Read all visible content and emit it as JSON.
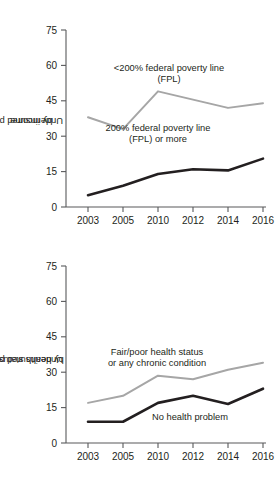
{
  "chart_data": [
    {
      "id": "income",
      "type": "line",
      "title": "",
      "xlabel": "",
      "ylabel": "Underinsured percentages by income",
      "ylabel_lines": [
        "Underinsured percentages",
        "by income"
      ],
      "categories": [
        "2003",
        "2005",
        "2010",
        "2012",
        "2014",
        "2016"
      ],
      "x": [
        2003,
        2005,
        2010,
        2012,
        2014,
        2016
      ],
      "ylim": [
        0,
        75
      ],
      "yticks": [
        0,
        15,
        30,
        45,
        60,
        75
      ],
      "ytick_labels": [
        "0",
        "15",
        "30",
        "45",
        "60",
        "75"
      ],
      "grid": false,
      "legend": "annotations",
      "series": [
        {
          "name": "<200% federal poverty line (FPL)",
          "label_lines": [
            "<200% federal poverty line",
            "(FPL)"
          ],
          "color": "#a6a6a6",
          "width": 2.0,
          "values": [
            38,
            33,
            49,
            45.5,
            42,
            44
          ]
        },
        {
          "name": "200% federal poverty line (FPL) or more",
          "label_lines": [
            "200% federal poverty line",
            "(FPL) or more"
          ],
          "color": "#231f20",
          "width": 2.6,
          "values": [
            5,
            9,
            14,
            16,
            15.5,
            20.5
          ]
        }
      ]
    },
    {
      "id": "health",
      "type": "line",
      "title": "",
      "xlabel": "",
      "ylabel": "Underinsured percentages by health status",
      "ylabel_lines": [
        "Underinsured percentages",
        "by health status"
      ],
      "categories": [
        "2003",
        "2005",
        "2010",
        "2012",
        "2014",
        "2016"
      ],
      "x": [
        2003,
        2005,
        2010,
        2012,
        2014,
        2016
      ],
      "ylim": [
        0,
        75
      ],
      "yticks": [
        0,
        15,
        30,
        45,
        60,
        75
      ],
      "ytick_labels": [
        "0",
        "15",
        "30",
        "45",
        "60",
        "75"
      ],
      "grid": false,
      "legend": "annotations",
      "series": [
        {
          "name": "Fair/poor health status or any chronic condition",
          "label_lines": [
            "Fair/poor health status",
            "or any chronic condition"
          ],
          "color": "#a6a6a6",
          "width": 2.0,
          "values": [
            17,
            20,
            28.5,
            27,
            31,
            34
          ]
        },
        {
          "name": "No health problem",
          "label_lines": [
            "No health problem"
          ],
          "color": "#231f20",
          "width": 2.6,
          "values": [
            9,
            9,
            17,
            20,
            16.5,
            23
          ]
        }
      ]
    }
  ],
  "panels": {
    "income": {
      "ylabel_line1": "Underinsured percentages",
      "ylabel_line2": "by income",
      "annot_a_line1": "<200% federal poverty line",
      "annot_a_line2": "(FPL)",
      "annot_b_line1": "200% federal poverty line",
      "annot_b_line2": "(FPL) or more",
      "ytick_0": "0",
      "ytick_15": "15",
      "ytick_30": "30",
      "ytick_45": "45",
      "ytick_60": "60",
      "ytick_75": "75",
      "xtick_0": "2003",
      "xtick_1": "2005",
      "xtick_2": "2010",
      "xtick_3": "2012",
      "xtick_4": "2014",
      "xtick_5": "2016"
    },
    "health": {
      "ylabel_line1": "Underinsured percentages",
      "ylabel_line2": "by health status",
      "annot_a_line1": "Fair/poor health status",
      "annot_a_line2": "or any chronic condition",
      "annot_b_line1": "No health problem",
      "ytick_0": "0",
      "ytick_15": "15",
      "ytick_30": "30",
      "ytick_45": "45",
      "ytick_60": "60",
      "ytick_75": "75",
      "xtick_0": "2003",
      "xtick_1": "2005",
      "xtick_2": "2010",
      "xtick_3": "2012",
      "xtick_4": "2014",
      "xtick_5": "2016"
    }
  },
  "colors": {
    "series_gray": "#a6a6a6",
    "series_black": "#231f20",
    "axis": "#58595b",
    "background": "#ffffff"
  }
}
